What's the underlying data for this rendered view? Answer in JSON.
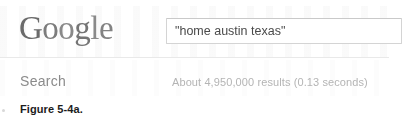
{
  "figure": {
    "caption": "Figure 5-4a."
  },
  "brand": {
    "name": "Google",
    "letters": [
      "G",
      "o",
      "o",
      "g",
      "l",
      "e"
    ],
    "logo_color": "#6f6f6f"
  },
  "search": {
    "query_value": "\"home austin texas\"",
    "placeholder": "",
    "submit_label": "Search"
  },
  "results": {
    "summary": "About 4,950,000 results (0.13 seconds)",
    "count_text": "4,950,000",
    "time_text": "0.13 seconds"
  },
  "colors": {
    "page_background": "#ffffff",
    "input_border": "#d4d4d4",
    "divider": "#e9e9e9",
    "muted_text": "#b4b4b4",
    "label_text": "#8b8b8b",
    "caption_text": "#1c1c1c"
  }
}
